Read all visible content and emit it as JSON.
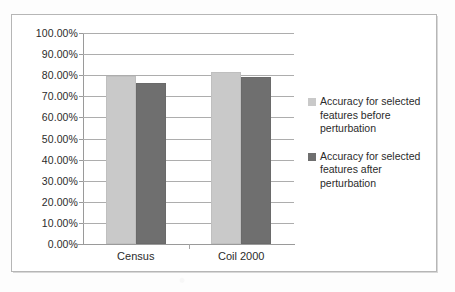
{
  "chart_data": {
    "type": "bar",
    "title": "",
    "xlabel": "",
    "ylabel": "",
    "categories": [
      "Census",
      "Coil 2000"
    ],
    "series": [
      {
        "name": "Accuracy for selected features before perturbation",
        "color": "#c9c9c9",
        "values": [
          0.795,
          0.815
        ]
      },
      {
        "name": "Accuracy for selected features after perturbation",
        "color": "#6f6f6f",
        "values": [
          0.765,
          0.79
        ]
      }
    ],
    "ylim": [
      0,
      1
    ],
    "ytick_labels": [
      "100.00%",
      "90.00%",
      "80.00%",
      "70.00%",
      "60.00%",
      "50.00%",
      "40.00%",
      "30.00%",
      "20.00%",
      "10.00%",
      "0.00%"
    ],
    "ytick_values": [
      1,
      0.9,
      0.8,
      0.7,
      0.6,
      0.5,
      0.4,
      0.3,
      0.2,
      0.1,
      0
    ],
    "grid": true,
    "legend_position": "right"
  },
  "legend": {
    "entries": [
      {
        "label": "Accuracy for selected features before perturbation"
      },
      {
        "label": "Accuracy for selected features after perturbation"
      }
    ]
  }
}
